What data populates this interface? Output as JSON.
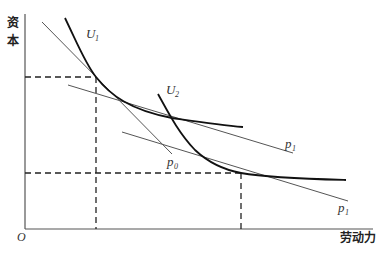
{
  "diagram": {
    "type": "isoquant-isocost",
    "axes": {
      "y_label": "资本",
      "y_label_line1": "资",
      "y_label_line2": "本",
      "x_label": "劳动力",
      "origin_label": "O"
    },
    "curves": [
      {
        "id": "U1",
        "label": "U",
        "subscript": "1"
      },
      {
        "id": "U2",
        "label": "U",
        "subscript": "2"
      }
    ],
    "lines": [
      {
        "id": "p0",
        "label": "p",
        "subscript": "0"
      },
      {
        "id": "p1_upper",
        "label": "p",
        "subscript": "1"
      },
      {
        "id": "p1_lower",
        "label": "p",
        "subscript": "1"
      }
    ],
    "guides": [
      {
        "id": "tangent-point-1",
        "style": "dashed"
      },
      {
        "id": "tangent-point-2",
        "style": "dashed"
      }
    ]
  }
}
